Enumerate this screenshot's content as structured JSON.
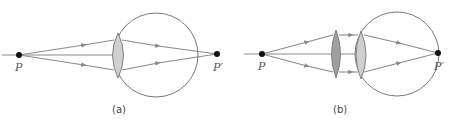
{
  "figure": {
    "panels": [
      {
        "id": "a",
        "caption": "(a)",
        "object_label": "P",
        "image_label": "P′",
        "lenses": [
          "eye-lens"
        ]
      },
      {
        "id": "b",
        "caption": "(b)",
        "object_label": "P",
        "image_label": "P′",
        "lenses": [
          "corrective-lens",
          "eye-lens"
        ]
      }
    ],
    "colors": {
      "ray": "#8a8a8a",
      "eyeball": "#7a7a7a",
      "eye_lens_fill": "#d0d0d0",
      "corrective_lens_fill": "#a0a0a0",
      "point": "#111111"
    }
  }
}
